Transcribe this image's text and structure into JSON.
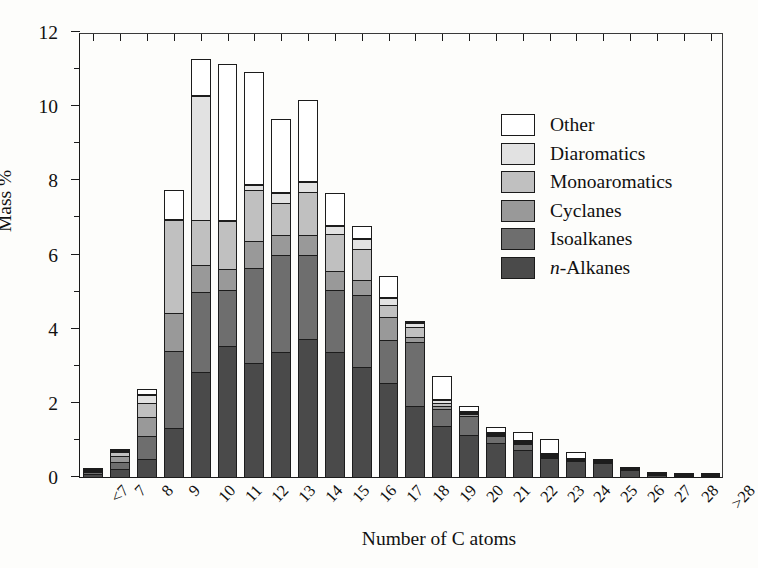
{
  "chart_data": {
    "type": "bar",
    "subtype": "stacked-vertical",
    "title": "",
    "xlabel": "Number of C atoms",
    "ylabel": "Mass %",
    "ylim": [
      0,
      12
    ],
    "ytick_labels": [
      "0",
      "2",
      "4",
      "6",
      "8",
      "10",
      "12"
    ],
    "ytick_values": [
      0,
      2,
      4,
      6,
      8,
      10,
      12
    ],
    "yminor_values": [
      1,
      3,
      5,
      7,
      9,
      11
    ],
    "grid": false,
    "legend_position": "top-right-inside",
    "categories": [
      "<7",
      "7",
      "8",
      "9",
      "10",
      "11",
      "12",
      "13",
      "14",
      "15",
      "16",
      "17",
      "18",
      "19",
      "20",
      "21",
      "22",
      "23",
      "24",
      "25",
      "26",
      "27",
      "28",
      ">28"
    ],
    "series": [
      {
        "name": "n-Alkanes",
        "color": "#4a4a4a",
        "values": [
          0.1,
          0.25,
          0.5,
          1.35,
          2.85,
          3.55,
          3.1,
          3.4,
          3.75,
          3.4,
          3.0,
          2.55,
          1.95,
          1.4,
          1.15,
          0.95,
          0.75,
          0.55,
          0.45,
          0.4,
          0.22,
          0.09,
          0.05,
          0.04
        ]
      },
      {
        "name": "Isoalkanes",
        "color": "#6e6e6e",
        "values": [
          0.08,
          0.22,
          0.65,
          2.1,
          2.2,
          1.55,
          2.6,
          2.65,
          2.3,
          1.7,
          1.95,
          1.2,
          1.75,
          0.5,
          0.55,
          0.22,
          0.2,
          0.05,
          0.04,
          0.02,
          0.02,
          0.01,
          0.01,
          0.01
        ]
      },
      {
        "name": "Cyclanes",
        "color": "#999999",
        "values": [
          0.06,
          0.18,
          0.55,
          1.05,
          0.75,
          0.6,
          0.75,
          0.55,
          0.55,
          0.55,
          0.45,
          0.65,
          0.15,
          0.1,
          0.08,
          0.05,
          0.03,
          0.02,
          0.01,
          0.01,
          0.0,
          0.0,
          0.0,
          0.0
        ]
      },
      {
        "name": "Monoaromatics",
        "color": "#c0c0c0",
        "values": [
          0.04,
          0.12,
          0.4,
          2.55,
          1.25,
          1.3,
          1.4,
          0.9,
          1.2,
          1.0,
          0.85,
          0.35,
          0.3,
          0.1,
          0.04,
          0.03,
          0.02,
          0.01,
          0.0,
          0.0,
          0.0,
          0.0,
          0.0,
          0.0
        ]
      },
      {
        "name": "Diaromatics",
        "color": "#e2e2e2",
        "values": [
          0.0,
          0.06,
          0.25,
          0.0,
          3.35,
          0.0,
          0.15,
          0.3,
          0.3,
          0.25,
          0.3,
          0.2,
          0.15,
          0.1,
          0.04,
          0.02,
          0.01,
          0.01,
          0.0,
          0.0,
          0.0,
          0.0,
          0.0,
          0.0
        ]
      },
      {
        "name": "Other",
        "color": "#ffffff",
        "values": [
          0.02,
          0.07,
          0.15,
          0.8,
          1.0,
          4.25,
          3.05,
          2.0,
          2.2,
          0.9,
          0.35,
          0.6,
          0.05,
          0.65,
          0.15,
          0.15,
          0.25,
          0.4,
          0.2,
          0.03,
          0.02,
          0.01,
          0.01,
          0.01
        ]
      }
    ]
  },
  "legend": {
    "items": [
      {
        "label": "Other",
        "color": "#ffffff"
      },
      {
        "label": "Diaromatics",
        "color": "#e2e2e2"
      },
      {
        "label": "Monoaromatics",
        "color": "#c0c0c0"
      },
      {
        "label": "Cyclanes",
        "color": "#999999"
      },
      {
        "label": "Isoalkanes",
        "color": "#6e6e6e"
      },
      {
        "label": "n-Alkanes",
        "color": "#4a4a4a"
      }
    ]
  },
  "axes": {
    "y_title": "Mass %",
    "x_title": "Number of C atoms"
  }
}
